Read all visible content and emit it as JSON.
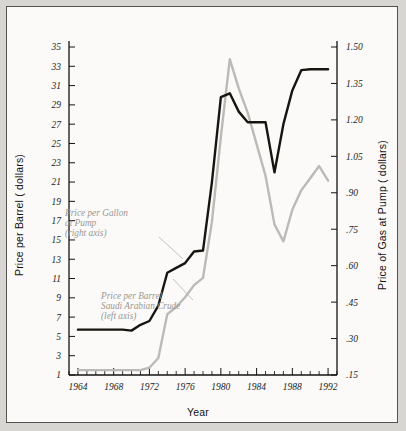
{
  "figure": {
    "background_color": "#fbfaf8",
    "border_color": "#55524e",
    "page_color": "#d8d6d2"
  },
  "axes": {
    "left_title": "Price per Barrel ( dollars)",
    "right_title": "Price of Gas at Pump ( dollars)",
    "x_title": "Year"
  },
  "annotations": {
    "gas": {
      "line1": "Price per Gallon",
      "line2": "at Pump",
      "line3": "(right axis)"
    },
    "crude": {
      "line1": "Price per Barrel",
      "line2": "Saudi Arabian Crude",
      "line3": "(left axis)"
    }
  },
  "chart_data": {
    "type": "line",
    "title": "",
    "xlabel": "Year",
    "ylabel": "Price per Barrel ( dollars)",
    "y2label": "Price of Gas at Pump ( dollars)",
    "grid": false,
    "legend": "annotations-inline",
    "xlim": [
      1963,
      1993
    ],
    "xticks": [
      1964,
      1968,
      1972,
      1976,
      1980,
      1984,
      1988,
      1992
    ],
    "xtick_labels": [
      "1964",
      "1968",
      "1972",
      "1976",
      "1980",
      "1984",
      "1988",
      "1992"
    ],
    "x_minor_step": 1,
    "ylim": [
      1,
      35
    ],
    "yticks": [
      1,
      3,
      5,
      7,
      9,
      11,
      13,
      15,
      17,
      19,
      21,
      23,
      25,
      27,
      29,
      31,
      33,
      35
    ],
    "ytick_labels": [
      "1",
      "3",
      "5",
      "7",
      "9",
      "11",
      "13",
      "15",
      "17",
      "19",
      "21",
      "23",
      "25",
      "27",
      "29",
      "31",
      "33",
      "35"
    ],
    "y2lim": [
      0.15,
      1.5
    ],
    "y2ticks": [
      0.15,
      0.3,
      0.45,
      0.6,
      0.75,
      0.9,
      1.05,
      1.2,
      1.35,
      1.5
    ],
    "y2tick_labels": [
      ".15",
      ".30",
      ".45",
      ".60",
      ".75",
      ".90",
      "1.05",
      "1.20",
      "1.35",
      "1.50"
    ],
    "x": [
      1964,
      1965,
      1966,
      1967,
      1968,
      1969,
      1970,
      1971,
      1972,
      1973,
      1974,
      1975,
      1976,
      1977,
      1978,
      1979,
      1980,
      1981,
      1982,
      1983,
      1984,
      1985,
      1986,
      1987,
      1988,
      1989,
      1990,
      1991,
      1992
    ],
    "series": [
      {
        "name": "Price per Barrel Saudi Arabian Crude (left axis)",
        "axis": "left",
        "color": "#17150f",
        "units": "dollars per barrel",
        "values": [
          5.7,
          5.7,
          5.7,
          5.7,
          5.7,
          5.7,
          5.6,
          6.2,
          6.6,
          8.2,
          11.6,
          12.1,
          12.6,
          13.8,
          13.9,
          21.0,
          29.8,
          30.2,
          28.3,
          27.2,
          27.2,
          27.2,
          22.0,
          27.0,
          30.5,
          32.6,
          32.7,
          32.7,
          32.7
        ]
      },
      {
        "name": "Price per Gallon at Pump (right axis)",
        "axis": "right",
        "color": "#bcbab6",
        "units": "dollars per gallon",
        "values": [
          0.17,
          0.17,
          0.17,
          0.17,
          0.17,
          0.17,
          0.17,
          0.17,
          0.18,
          0.22,
          0.4,
          0.43,
          0.47,
          0.52,
          0.55,
          0.78,
          1.13,
          1.45,
          1.33,
          1.23,
          1.1,
          0.97,
          0.77,
          0.7,
          0.83,
          0.91,
          0.96,
          1.01,
          0.95
        ]
      }
    ]
  }
}
